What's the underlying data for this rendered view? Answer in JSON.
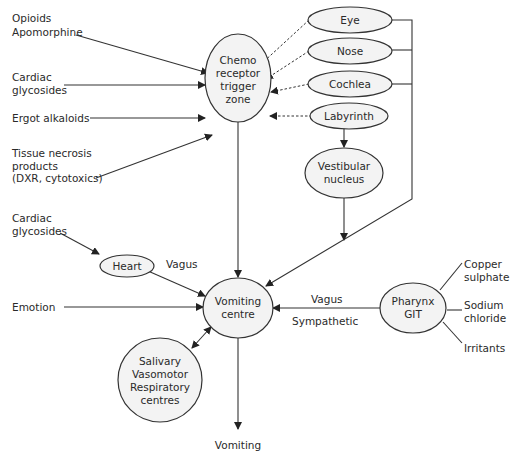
{
  "nodes": {
    "ctz": {
      "lines": [
        "Chemo",
        "receptor",
        "trigger",
        "zone"
      ]
    },
    "eye": {
      "label": "Eye"
    },
    "nose": {
      "label": "Nose"
    },
    "cochlea": {
      "label": "Cochlea"
    },
    "labyrinth": {
      "label": "Labyrinth"
    },
    "vestibular": {
      "lines": [
        "Vestibular",
        "nucleus"
      ]
    },
    "heart": {
      "label": "Heart"
    },
    "vomiting_centre": {
      "lines": [
        "Vomiting",
        "centre"
      ]
    },
    "salivary": {
      "lines": [
        "Salivary",
        "Vasomotor",
        "Respiratory",
        "centres"
      ]
    },
    "pharynx": {
      "lines": [
        "Pharynx",
        "GIT"
      ]
    }
  },
  "inputs": {
    "opioids": [
      "Opioids",
      "Apomorphine"
    ],
    "cardiac_ctz": [
      "Cardiac",
      "glycosides"
    ],
    "ergot": [
      "Ergot alkaloids"
    ],
    "tissue": [
      "Tissue necrosis",
      "products",
      "(DXR, cytotoxics)"
    ],
    "cardiac_heart": [
      "Cardiac",
      "glycosides"
    ],
    "emotion": [
      "Emotion"
    ],
    "copper": [
      "Copper",
      "sulphate"
    ],
    "sodium": [
      "Sodium",
      "chloride"
    ],
    "irritants": [
      "Irritants"
    ]
  },
  "edge_labels": {
    "heart_vagus": "Vagus",
    "pharynx_vagus": "Vagus",
    "pharynx_sympathetic": "Sympathetic"
  },
  "output": {
    "label": "Vomiting"
  },
  "colors": {
    "node_fill": "#f3f3f3",
    "stroke": "#333333",
    "text": "#2a2a2a"
  }
}
